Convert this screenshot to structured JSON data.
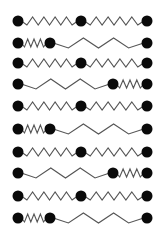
{
  "diagram": {
    "colors": {
      "ball": "#0a0a0a",
      "spring": "#555555",
      "background": "#ffffff"
    },
    "ball_radius": 5.5,
    "rows": [
      {
        "y": 21,
        "pattern": "A",
        "balls": [
          18,
          81,
          147
        ],
        "springs": [
          {
            "from": 18,
            "to": 81,
            "peaks": 5,
            "amp": 4
          },
          {
            "from": 81,
            "to": 147,
            "peaks": 5,
            "amp": 4
          }
        ]
      },
      {
        "y": 43,
        "pattern": "B",
        "balls": [
          18,
          50,
          147
        ],
        "springs": [
          {
            "from": 18,
            "to": 50,
            "peaks": 4,
            "amp": 4
          },
          {
            "from": 50,
            "to": 147,
            "peaks": 3,
            "amp": 5
          }
        ]
      },
      {
        "y": 63,
        "pattern": "A",
        "balls": [
          18,
          81,
          147
        ],
        "springs": [
          {
            "from": 18,
            "to": 81,
            "peaks": 5,
            "amp": 4
          },
          {
            "from": 81,
            "to": 147,
            "peaks": 5,
            "amp": 4
          }
        ]
      },
      {
        "y": 84,
        "pattern": "C",
        "balls": [
          18,
          113,
          147
        ],
        "springs": [
          {
            "from": 18,
            "to": 113,
            "peaks": 3,
            "amp": 5
          },
          {
            "from": 113,
            "to": 147,
            "peaks": 4,
            "amp": 4
          }
        ]
      },
      {
        "y": 106,
        "pattern": "A",
        "balls": [
          18,
          81,
          147
        ],
        "springs": [
          {
            "from": 18,
            "to": 81,
            "peaks": 5,
            "amp": 4
          },
          {
            "from": 81,
            "to": 147,
            "peaks": 5,
            "amp": 4
          }
        ]
      },
      {
        "y": 129,
        "pattern": "B",
        "balls": [
          18,
          50,
          147
        ],
        "springs": [
          {
            "from": 18,
            "to": 50,
            "peaks": 4,
            "amp": 4
          },
          {
            "from": 50,
            "to": 147,
            "peaks": 3,
            "amp": 5
          }
        ]
      },
      {
        "y": 152,
        "pattern": "A",
        "balls": [
          18,
          81,
          147
        ],
        "springs": [
          {
            "from": 18,
            "to": 81,
            "peaks": 5,
            "amp": 4
          },
          {
            "from": 81,
            "to": 147,
            "peaks": 5,
            "amp": 4
          }
        ]
      },
      {
        "y": 173,
        "pattern": "C",
        "balls": [
          18,
          113,
          147
        ],
        "springs": [
          {
            "from": 18,
            "to": 113,
            "peaks": 3,
            "amp": 5
          },
          {
            "from": 113,
            "to": 147,
            "peaks": 4,
            "amp": 4
          }
        ]
      },
      {
        "y": 196,
        "pattern": "A",
        "balls": [
          18,
          81,
          147
        ],
        "springs": [
          {
            "from": 18,
            "to": 81,
            "peaks": 5,
            "amp": 4
          },
          {
            "from": 81,
            "to": 147,
            "peaks": 5,
            "amp": 4
          }
        ]
      },
      {
        "y": 218,
        "pattern": "B",
        "balls": [
          18,
          50,
          147
        ],
        "springs": [
          {
            "from": 18,
            "to": 50,
            "peaks": 4,
            "amp": 4
          },
          {
            "from": 50,
            "to": 147,
            "peaks": 3,
            "amp": 5
          }
        ]
      }
    ]
  }
}
